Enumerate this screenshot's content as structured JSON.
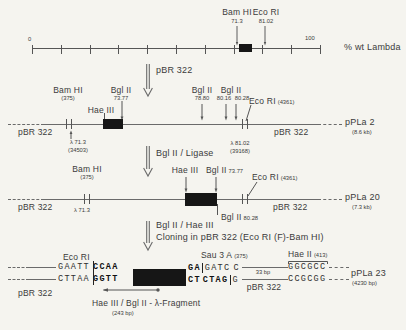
{
  "ruler": {
    "site1_enzyme": "Bam HI",
    "site1_pos": "71.3",
    "site2_enzyme": "Eco RI",
    "site2_pos": "81.02",
    "scale_start": "0",
    "scale_end": "100",
    "unit": "% wt Lambda"
  },
  "steps": {
    "step1": "pBR 322",
    "step2": "Bgl II / Ligase",
    "step3a": "Bgl II / Hae III",
    "step3b": "Cloning in pBR 322 (Eco RI (F)-Bam HI)"
  },
  "map2": {
    "left_vector": "pBR 322",
    "right_vector": "pBR 322",
    "bam": "Bam HI",
    "bam_pos": "(375)",
    "bgl1": "Bgl II",
    "bgl1_pos": "73.77",
    "hae": "Hae III",
    "bgl2": "Bgl II",
    "bgl2_pos": "78.80",
    "bgl3": "Bgl II",
    "bgl3_pos1": "80.16",
    "bgl3_pos2": "80.28",
    "eco": "Eco RI",
    "eco_pos": "(4361)",
    "lambda_left": "λ 71.3",
    "lambda_left_bp": "(34503)",
    "lambda_right": "λ 81.02",
    "lambda_right_bp": "(39168)",
    "plasmid": "pPLa 2",
    "plasmid_size": "(8.6 kb)"
  },
  "map3": {
    "left_vector": "pBR 322",
    "right_vector": "pBR 322",
    "bam": "Bam HI",
    "bam_pos": "(375)",
    "hae": "Hae III",
    "bgl1": "Bgl II",
    "bgl1_pos": "73.77",
    "bgl2": "Bgl II",
    "bgl2_pos": "80.28",
    "eco": "Eco RI",
    "eco_pos": "(4361)",
    "lambda_left": "λ 71.3",
    "plasmid": "pPLa 20",
    "plasmid_size": "(7.3 kb)"
  },
  "final": {
    "eco": "Eco RI",
    "left_vector": "pBR 322",
    "seq_top_left": "GAATT",
    "seq_top_left_insert": "CCAA",
    "seq_bottom_left": "CTTAA",
    "seq_bottom_left_insert": "GGTT",
    "seq_top_right_insert": "GA",
    "seq_top_right_site": "GATC",
    "seq_top_right_vector": "C",
    "seq_bottom_right_insert": "CT",
    "seq_bottom_right_site": "CTAG",
    "seq_bottom_right_vector": "G",
    "sau": "Sau 3 A",
    "sau_pos": "(375)",
    "spacer": "33 bp",
    "mid_vector": "pBR 322",
    "hae2": "Hae II",
    "hae2_pos": "(413)",
    "seq_top_far": "GGCGCC",
    "seq_bottom_far": "CCGCGG",
    "plasmid": "pPLa 23",
    "plasmid_size": "(4230 bp)",
    "fragment": "Hae III / Bgl II - λ-Fragment",
    "fragment_size": "(243 bp)"
  }
}
